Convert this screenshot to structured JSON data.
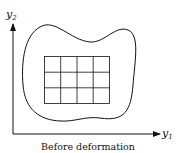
{
  "diagram": {
    "caption": "Before deformation",
    "axes": {
      "x_label": "y",
      "x_sub": "1",
      "y_label": "y",
      "y_sub": "2"
    },
    "grid": {
      "columns": 4,
      "rows": 3
    },
    "colors": {
      "stroke": "#111111",
      "background": "#ffffff"
    }
  }
}
